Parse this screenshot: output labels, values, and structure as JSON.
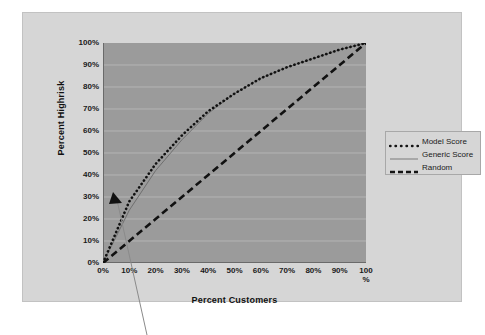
{
  "chart_data": {
    "type": "line",
    "title": "",
    "xlabel": "Percent Customers",
    "ylabel": "Percent Highrisk",
    "xlim": [
      0,
      100
    ],
    "ylim": [
      0,
      100
    ],
    "grid": true,
    "legend_position": "right",
    "x": [
      0,
      10,
      20,
      30,
      40,
      50,
      60,
      70,
      80,
      90,
      100
    ],
    "xticklabels": [
      "0%",
      "10%",
      "20%",
      "30%",
      "40%",
      "50%",
      "60%",
      "70%",
      "80%",
      "90%",
      "100 %"
    ],
    "yticklabels": [
      "0%",
      "10%",
      "20%",
      "30%",
      "40%",
      "50%",
      "60%",
      "70%",
      "80%",
      "90%",
      "100%"
    ],
    "series": [
      {
        "name": "Model Score",
        "style": "dotted",
        "color": "#111111",
        "values": [
          0,
          28,
          45,
          58,
          69,
          77,
          84,
          89,
          93,
          97,
          100
        ]
      },
      {
        "name": "Generic Score",
        "style": "solid",
        "color": "#6f6f6f",
        "values": [
          0,
          24,
          42,
          56,
          68,
          77,
          84,
          89,
          93,
          97,
          100
        ]
      },
      {
        "name": "Random",
        "style": "dashed",
        "color": "#111111",
        "values": [
          0,
          10,
          20,
          30,
          40,
          50,
          60,
          70,
          80,
          90,
          100
        ]
      }
    ],
    "annotations": [
      {
        "name": "callout-arrow",
        "x": 14,
        "y": 20,
        "label": ""
      }
    ]
  },
  "axes": {
    "y_title": "Percent Highrisk",
    "x_title": "Percent Customers",
    "y_ticks": [
      "100%",
      "90%",
      "80%",
      "70%",
      "60%",
      "50%",
      "40%",
      "30%",
      "20%",
      "10%",
      "0%"
    ],
    "x_ticks": [
      "0%",
      "10%",
      "20%",
      "30%",
      "40%",
      "50%",
      "60%",
      "70%",
      "80%",
      "90%"
    ],
    "x_last_tick_line1": "100",
    "x_last_tick_line2": "%"
  },
  "legend": {
    "items": [
      {
        "label": "Model Score",
        "style": "dotted",
        "color": "#111111"
      },
      {
        "label": "Generic Score",
        "style": "solid",
        "color": "#7a7a7a"
      },
      {
        "label": "Random",
        "style": "dashed",
        "color": "#111111"
      }
    ]
  },
  "colors": {
    "page_background": "#ffffff",
    "chart_frame": "#d6d6d6",
    "plot_area": "#9b9b9b",
    "gridline": "#b4b4b4",
    "axis_line": "#5a5a5a",
    "text": "#1a1a1a"
  }
}
